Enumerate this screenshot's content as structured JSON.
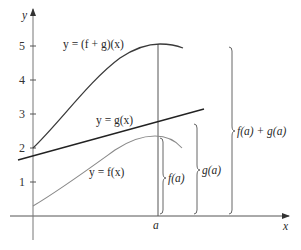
{
  "diagram": {
    "type": "function-sum-graph",
    "axes": {
      "x_label": "x",
      "y_label": "y",
      "y_ticks": [
        "1",
        "2",
        "3",
        "4",
        "5"
      ],
      "x_marker": "a"
    },
    "curves": {
      "sum": {
        "label": "y = (f + g)(x)",
        "color": "#3a3a3a"
      },
      "g": {
        "label": "y = g(x)",
        "color": "#222222"
      },
      "f": {
        "label": "y = f(x)",
        "color": "#8a8a8a"
      }
    },
    "braces": {
      "f_a": "f(a)",
      "g_a": "g(a)",
      "sum_a": "f(a) + g(a)"
    }
  }
}
